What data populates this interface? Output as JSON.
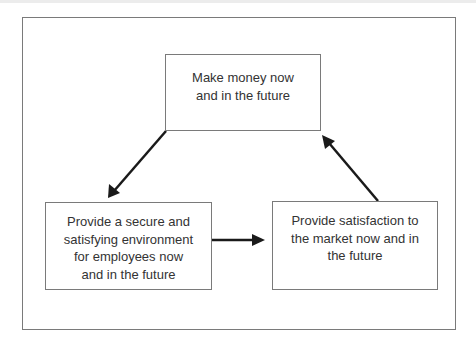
{
  "diagram": {
    "type": "cycle",
    "nodes": [
      {
        "id": "top",
        "lines": [
          "Make money now",
          "and in the future"
        ]
      },
      {
        "id": "left",
        "lines": [
          "Provide a secure and",
          "satisfying environment",
          "for employees now",
          "and in the future"
        ]
      },
      {
        "id": "right",
        "lines": [
          "Provide satisfaction to",
          "the market now and in",
          "the future"
        ]
      }
    ],
    "edges": [
      {
        "from": "top",
        "to": "left"
      },
      {
        "from": "left",
        "to": "right"
      },
      {
        "from": "right",
        "to": "top"
      }
    ],
    "colors": {
      "border": "#7a7a7a",
      "arrow": "#1a1a1a",
      "text": "#333333"
    }
  }
}
